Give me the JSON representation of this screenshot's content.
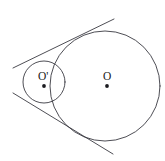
{
  "figure": {
    "kind": "geometry-diagram",
    "caption_fragment": "",
    "background_color": "#ffffff",
    "stroke_color": "#3a3a42",
    "label_color": "#1b1b20",
    "canvas": {
      "width": 165,
      "height": 161
    },
    "labels": {
      "large_circle_center": "O",
      "small_circle_center": "O'"
    },
    "shapes": {
      "large_circle": {
        "cx": 105,
        "cy": 86,
        "r": 55
      },
      "small_circle": {
        "cx": 44,
        "cy": 82,
        "r": 21
      },
      "large_center_dot": {
        "cx": 107,
        "cy": 86,
        "r": 1.9
      },
      "small_center_dot": {
        "cx": 44,
        "cy": 86,
        "r": 1.9
      },
      "upper_tangent": {
        "x1": 13,
        "y1": 68,
        "x2": 114,
        "y2": 19
      },
      "lower_tangent": {
        "x1": 13,
        "y1": 93,
        "x2": 113,
        "y2": 154
      }
    },
    "label_positions": {
      "large_circle_center": {
        "x": 103,
        "y": 80
      },
      "small_circle_center": {
        "x": 38,
        "y": 80
      }
    }
  }
}
